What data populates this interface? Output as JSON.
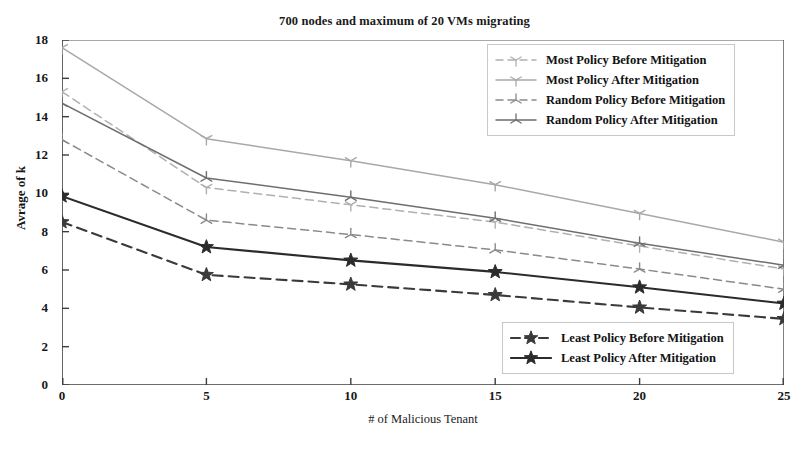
{
  "chart_data": {
    "type": "line",
    "title": "700 nodes and maximum of 20 VMs migrating",
    "xlabel": "# of Malicious Tenant",
    "ylabel": "Avrage of k",
    "x": [
      0,
      5,
      10,
      15,
      20,
      25
    ],
    "xlim": [
      0,
      25
    ],
    "ylim": [
      0,
      18
    ],
    "xticks": [
      "0",
      "5",
      "10",
      "15",
      "20",
      "25"
    ],
    "yticks": [
      "0",
      "2",
      "4",
      "6",
      "8",
      "10",
      "12",
      "14",
      "16",
      "18"
    ],
    "grid": false,
    "legend_position": "upper right and lower right (two boxes)",
    "series": [
      {
        "name": "Most Policy Before Mitigation",
        "values": [
          15.3,
          10.3,
          9.4,
          8.5,
          7.25,
          6.05
        ],
        "color": "#b0b0b0",
        "style": "dashed",
        "marker": "tri-down",
        "legend": "top"
      },
      {
        "name": "Most Policy After Mitigation",
        "values": [
          17.6,
          12.85,
          11.7,
          10.45,
          8.95,
          7.45
        ],
        "color": "#a8a8a8",
        "style": "solid",
        "marker": "tri-down",
        "legend": "top"
      },
      {
        "name": "Random Policy Before Mitigation",
        "values": [
          12.8,
          8.6,
          7.85,
          7.05,
          6.05,
          5.0
        ],
        "color": "#8a8a8a",
        "style": "dashed",
        "marker": "tri-up",
        "legend": "top"
      },
      {
        "name": "Random Policy After Mitigation",
        "values": [
          14.7,
          10.8,
          9.8,
          8.7,
          7.4,
          6.25
        ],
        "color": "#6e6e6e",
        "style": "solid",
        "marker": "tri-up",
        "legend": "top"
      },
      {
        "name": "Least Policy Before Mitigation",
        "values": [
          8.5,
          5.75,
          5.25,
          4.7,
          4.05,
          3.45
        ],
        "color": "#3a3a3a",
        "style": "dashed",
        "marker": "star",
        "legend": "bottom"
      },
      {
        "name": "Least Policy After Mitigation",
        "values": [
          9.85,
          7.2,
          6.5,
          5.9,
          5.1,
          4.25
        ],
        "color": "#2b2b2b",
        "style": "solid",
        "marker": "star",
        "legend": "bottom"
      }
    ]
  },
  "axis": {
    "spine_color": "#3d3d3d"
  },
  "legend_top": {
    "items": [
      "Most Policy Before Mitigation",
      "Most Policy After Mitigation",
      "Random Policy Before Mitigation",
      "Random Policy After Mitigation"
    ]
  },
  "legend_bottom": {
    "items": [
      "Least Policy Before Mitigation",
      "Least Policy After Mitigation"
    ]
  }
}
